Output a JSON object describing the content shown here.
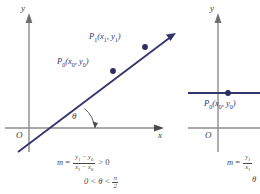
{
  "figures": [
    {
      "id": "positive-slope",
      "axes": {
        "y_label": "y",
        "x_label": "x",
        "origin_label": "O"
      },
      "points": [
        {
          "name": "P1",
          "label_main": "P",
          "label_sub": "1",
          "label_args": "(x",
          "arg1_sub": "1",
          "arg_mid": ", y",
          "arg2_sub": "1",
          "arg_end": ")"
        },
        {
          "name": "P0",
          "label_main": "P",
          "label_sub": "0",
          "label_args": "(x",
          "arg1_sub": "0",
          "arg_mid": ", y",
          "arg2_sub": "0",
          "arg_end": ")"
        }
      ],
      "angle_label": "θ",
      "formula": {
        "lhs": "m",
        "equals": "=",
        "numerator_a": "y",
        "numerator_a_sub": "1",
        "numerator_minus": " − y",
        "numerator_b_sub": "0",
        "denominator_a": "x",
        "denominator_a_sub": "1",
        "denominator_minus": " − x",
        "denominator_b_sub": "0",
        "relation": "> 0"
      },
      "condition": {
        "left": "0 < ",
        "theta": "θ",
        "mid": " < ",
        "frac_num": "π",
        "frac_den": "2"
      }
    },
    {
      "id": "zero-slope",
      "axes": {
        "y_label": "y",
        "origin_label": "O"
      },
      "points": [
        {
          "name": "P0",
          "label_main": "P",
          "label_sub": "0",
          "label_args": "(x",
          "arg1_sub": "0",
          "arg_mid": ", y",
          "arg2_sub": "0",
          "arg_end": ")"
        }
      ],
      "formula": {
        "lhs": "m",
        "equals": "=",
        "numerator_a": "y",
        "numerator_a_sub": "1",
        "denominator_a": "x",
        "denominator_a_sub": "1"
      },
      "condition": {
        "theta": "θ"
      }
    }
  ],
  "colors": {
    "line": "#33336e",
    "point": "#2d2d66",
    "axis": "#8c8c8c",
    "text": "#3d3d3d",
    "background": "#ffffff"
  }
}
